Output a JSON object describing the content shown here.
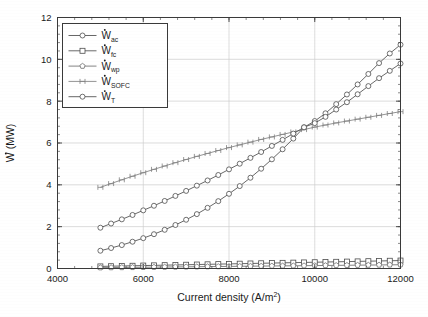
{
  "chart_data": {
    "type": "line",
    "title": "",
    "xlabel": "Current density (A/m2)",
    "xlabel_base": "Current density (A/m",
    "xlabel_sup": "2",
    "xlabel_tail": ")",
    "ylabel": "W (MW)",
    "ylabel_symbol": "W",
    "ylabel_unit": "(MW)",
    "xlim": [
      4000,
      12000
    ],
    "ylim": [
      0,
      12
    ],
    "xticks": [
      4000,
      6000,
      8000,
      10000,
      12000
    ],
    "yticks": [
      0,
      2,
      4,
      6,
      8,
      10,
      12
    ],
    "xtick_labels": [
      "4000",
      "6000",
      "8000",
      "10000",
      "12000"
    ],
    "ytick_labels": [
      "0",
      "2",
      "4",
      "6",
      "8",
      "10",
      "12"
    ],
    "grid": true,
    "minor_ticks": true,
    "legend_position": "upper left",
    "x": [
      5000,
      5250,
      5500,
      5750,
      6000,
      6250,
      6500,
      6750,
      7000,
      7250,
      7500,
      7750,
      8000,
      8250,
      8500,
      8750,
      9000,
      9250,
      9500,
      9750,
      10000,
      10250,
      10500,
      10750,
      11000,
      11250,
      11500,
      11750,
      12000
    ],
    "series": [
      {
        "name": "W_ac",
        "label_base": "W",
        "label_sub": "ac",
        "marker": "circle",
        "color": "#4d4d4d",
        "values": [
          0.85,
          0.98,
          1.12,
          1.28,
          1.45,
          1.64,
          1.85,
          2.08,
          2.33,
          2.6,
          2.9,
          3.22,
          3.57,
          3.94,
          4.34,
          4.77,
          5.22,
          5.7,
          6.21,
          6.75,
          7.05,
          7.42,
          7.86,
          8.32,
          8.8,
          9.3,
          9.82,
          10.28,
          10.7
        ]
      },
      {
        "name": "W_fc",
        "label_base": "W",
        "label_sub": "fc",
        "marker": "square",
        "color": "#4d4d4d",
        "values": [
          0.1,
          0.11,
          0.12,
          0.13,
          0.14,
          0.15,
          0.16,
          0.17,
          0.18,
          0.19,
          0.2,
          0.21,
          0.22,
          0.23,
          0.24,
          0.25,
          0.26,
          0.27,
          0.28,
          0.29,
          0.3,
          0.31,
          0.32,
          0.33,
          0.34,
          0.35,
          0.36,
          0.37,
          0.38
        ]
      },
      {
        "name": "W_wp",
        "label_base": "W",
        "label_sub": "wp",
        "marker": "pentagon",
        "color": "#6e6e6e",
        "values": [
          0.04,
          0.045,
          0.05,
          0.055,
          0.06,
          0.065,
          0.07,
          0.075,
          0.08,
          0.085,
          0.09,
          0.095,
          0.1,
          0.105,
          0.11,
          0.115,
          0.12,
          0.125,
          0.13,
          0.135,
          0.14,
          0.145,
          0.15,
          0.155,
          0.16,
          0.165,
          0.17,
          0.175,
          0.18
        ]
      },
      {
        "name": "W_SOFC",
        "label_base": "W",
        "label_sub": "SOFC",
        "marker": "hbar",
        "color": "#808080",
        "values": [
          3.88,
          4.06,
          4.24,
          4.41,
          4.58,
          4.74,
          4.9,
          5.06,
          5.21,
          5.36,
          5.5,
          5.64,
          5.78,
          5.91,
          6.04,
          6.17,
          6.29,
          6.41,
          6.53,
          6.64,
          6.76,
          6.86,
          6.96,
          7.05,
          7.14,
          7.23,
          7.32,
          7.41,
          7.5
        ]
      },
      {
        "name": "W_T",
        "label_base": "W",
        "label_sub": "T",
        "marker": "circle",
        "color": "#4d4d4d",
        "values": [
          1.95,
          2.15,
          2.35,
          2.56,
          2.78,
          3.0,
          3.23,
          3.47,
          3.71,
          3.96,
          4.21,
          4.47,
          4.74,
          5.01,
          5.29,
          5.57,
          5.86,
          6.15,
          6.45,
          6.75,
          6.95,
          7.25,
          7.6,
          7.95,
          8.33,
          8.72,
          9.1,
          9.45,
          9.8
        ]
      }
    ]
  },
  "axes": {
    "y_axis_name": "w-dot-mw-axis",
    "x_axis_name": "current-density-axis"
  }
}
